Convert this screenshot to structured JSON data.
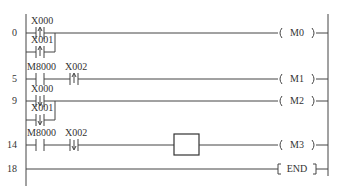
{
  "diagram": {
    "type": "PLC ladder diagram",
    "rungs": [
      {
        "step": "0",
        "contacts": [
          {
            "label": "X000",
            "type": "rising-edge"
          },
          {
            "label": "X001",
            "type": "rising-edge",
            "parallel": true
          }
        ],
        "coil": {
          "label": "M0",
          "type": "output"
        }
      },
      {
        "step": "5",
        "contacts": [
          {
            "label": "M8000",
            "type": "normally-open"
          },
          {
            "label": "X002",
            "type": "rising-edge"
          }
        ],
        "coil": {
          "label": "M1",
          "type": "output"
        }
      },
      {
        "step": "9",
        "contacts": [
          {
            "label": "X000",
            "type": "falling-edge"
          },
          {
            "label": "X001",
            "type": "falling-edge",
            "parallel": true
          }
        ],
        "coil": {
          "label": "M2",
          "type": "output"
        }
      },
      {
        "step": "14",
        "contacts": [
          {
            "label": "M8000",
            "type": "normally-open"
          },
          {
            "label": "X002",
            "type": "falling-edge"
          }
        ],
        "blank_box": true,
        "coil": {
          "label": "M3",
          "type": "output"
        }
      },
      {
        "step": "18",
        "contacts": [],
        "coil": {
          "label": "END",
          "type": "instruction"
        }
      }
    ]
  }
}
